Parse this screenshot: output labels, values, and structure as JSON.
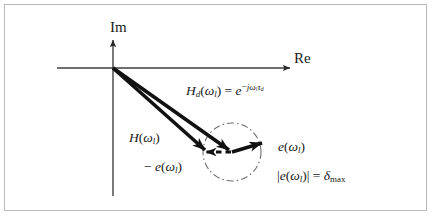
{
  "figure": {
    "type": "complex-plane-vector-diagram",
    "axes": {
      "imaginary_label": "Im",
      "real_label": "Re",
      "origin": {
        "x": 113,
        "y": 68
      }
    },
    "vectors": [
      {
        "name": "H",
        "label_parts": {
          "base": "H",
          "arg_open": "(",
          "omega": "ω",
          "arg_sub": "l",
          "arg_close": ")"
        },
        "from": {
          "x": 113,
          "y": 68
        },
        "to": {
          "x": 208,
          "y": 152
        }
      },
      {
        "name": "Hd",
        "label_parts": {
          "base": "H",
          "base_sub": "d",
          "arg_open": "(",
          "omega": "ω",
          "arg_sub": "l",
          "arg_close": ")",
          "equals": " = ",
          "exp_base": "e",
          "exp_sign": "−",
          "exp_j": "j",
          "exp_omega": "ω",
          "exp_omega_sub": "l",
          "exp_tau": "τ",
          "exp_tau_sub": "d"
        },
        "from": {
          "x": 113,
          "y": 68
        },
        "to": {
          "x": 232,
          "y": 152
        }
      },
      {
        "name": "e",
        "label_parts": {
          "base": "e",
          "arg_open": "(",
          "omega": "ω",
          "arg_sub": "l",
          "arg_close": ")"
        },
        "from": {
          "x": 232,
          "y": 152
        },
        "to": {
          "x": 261,
          "y": 143
        },
        "style": "solid"
      },
      {
        "name": "minus-e",
        "label_parts": {
          "minus": "− ",
          "base": "e",
          "arg_open": "(",
          "omega": "ω",
          "arg_sub": "l",
          "arg_close": ")"
        },
        "from": {
          "x": 232,
          "y": 152
        },
        "to": {
          "x": 207,
          "y": 152
        },
        "style": "dashed"
      }
    ],
    "circle": {
      "center": {
        "x": 232,
        "y": 152
      },
      "radius": 29,
      "style": "dash-dot",
      "meaning": "error magnitude bound"
    },
    "constraint": {
      "parts": {
        "bar_open": "|",
        "base": "e",
        "arg_open": "(",
        "omega": "ω",
        "arg_sub": "l",
        "arg_close": ")",
        "bar_close": "|",
        "equals": " = ",
        "delta": "δ",
        "delta_sub": "max"
      }
    },
    "colors": {
      "ink": "#1a1a1a",
      "axis": "#4a4a4a",
      "circle": "#6e6e6e",
      "frame": "#b9b9b9",
      "background": "#ffffff"
    }
  }
}
